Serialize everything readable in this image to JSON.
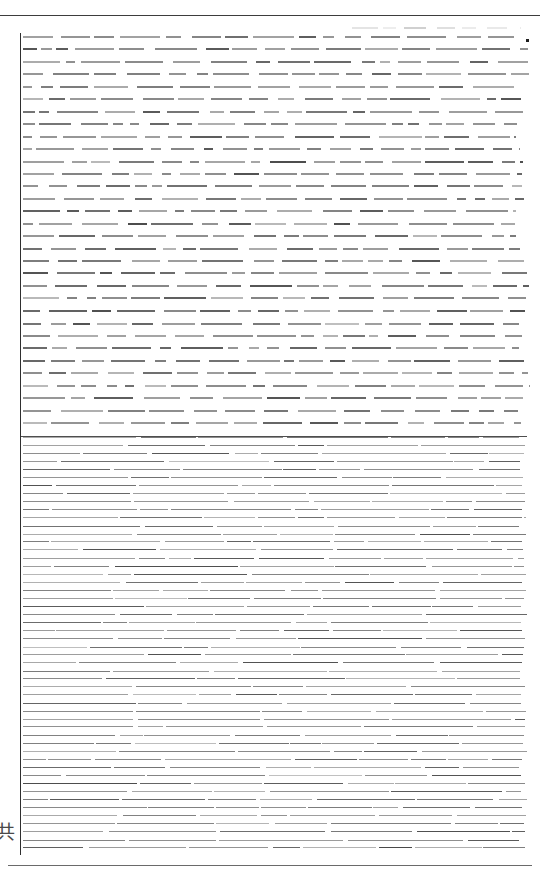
{
  "document": {
    "kind": "scanned-page",
    "legibility": "illegible",
    "page_width": 540,
    "page_height": 875,
    "background_color": "#ffffff",
    "ink_color": "#2a2a2a",
    "ink_color_light": "#8c8c8c",
    "rule_color": "#3d3d3d",
    "margin_glyph": "共",
    "margin_glyph_note": "partially cropped CJK glyph at left page edge",
    "rules": {
      "top": {
        "y": 15,
        "x": 0,
        "width": 540,
        "color": "#3d3d3d"
      },
      "bottom": {
        "y": 865,
        "x": 8,
        "width": 524,
        "color": "#6a6a6a"
      },
      "left_vertical": {
        "x": 20,
        "y": 33,
        "height": 822,
        "color": "#2f2f2f"
      },
      "section_separator": {
        "x": 21,
        "y": 436,
        "width": 506,
        "color": "#4e4e4e"
      }
    },
    "corner_mark": {
      "x": 526,
      "y": 39,
      "size": 3,
      "color": "#1d1d1d"
    },
    "header_fragment": {
      "x": 352,
      "y": 27,
      "width": 168,
      "color": "#b9b9b9",
      "note": "faint residual running-head, unreadable"
    },
    "sections": [
      {
        "name": "body-text",
        "role": "main paragraph text",
        "x": 23,
        "y": 36,
        "width": 507,
        "height": 398,
        "line_pitch": 12.45,
        "line_count": 32,
        "stroke_height": 2,
        "style": "word-cluster dashes",
        "readable_text": null
      },
      {
        "name": "dense-notes",
        "role": "footnotes / references",
        "x": 23,
        "y": 437,
        "width": 504,
        "height": 419,
        "line_pitch": 8.05,
        "line_count": 52,
        "stroke_height": 1,
        "style": "long continuous runs",
        "readable_text": null
      }
    ]
  }
}
